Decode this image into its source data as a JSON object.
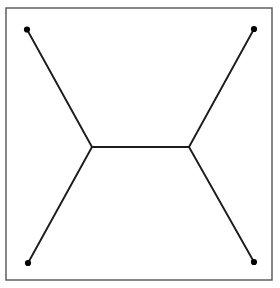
{
  "figure": {
    "background_color": "#ffffff",
    "canvas": {
      "width": 280,
      "height": 288
    },
    "frame": {
      "label": "bounding-box",
      "x": 6,
      "y": 8,
      "width": 266,
      "height": 272,
      "stroke_color": "#555555",
      "stroke_width": 1.4,
      "fill_color": "#ffffff"
    },
    "style": {
      "edge_color": "#1c1c1c",
      "edge_width": 1.9,
      "node_color": "#000000",
      "node_radius": 3.1
    },
    "terminals": [
      {
        "id": "T1",
        "label": "top-left-terminal",
        "x": 27,
        "y": 29.5
      },
      {
        "id": "T2",
        "label": "top-right-terminal",
        "x": 254,
        "y": 29
      },
      {
        "id": "T3",
        "label": "bottom-left-terminal",
        "x": 28,
        "y": 263
      },
      {
        "id": "T4",
        "label": "bottom-right-terminal",
        "x": 254,
        "y": 262
      }
    ],
    "steiner_points": [
      {
        "id": "S1",
        "label": "left-steiner-point",
        "x": 92,
        "y": 147
      },
      {
        "id": "S2",
        "label": "right-steiner-point",
        "x": 189,
        "y": 147
      }
    ],
    "edges": [
      {
        "id": "E1",
        "label": "edge-top-left-to-left-steiner",
        "x1": 27,
        "y1": 29.5,
        "x2": 92,
        "y2": 147
      },
      {
        "id": "E2",
        "label": "edge-bottom-left-to-left-steiner",
        "x1": 28,
        "y1": 263,
        "x2": 92,
        "y2": 147
      },
      {
        "id": "E3",
        "label": "edge-left-steiner-to-right-steiner",
        "x1": 92,
        "y1": 147,
        "x2": 189,
        "y2": 147
      },
      {
        "id": "E4",
        "label": "edge-top-right-to-right-steiner",
        "x1": 254,
        "y1": 29,
        "x2": 189,
        "y2": 147
      },
      {
        "id": "E5",
        "label": "edge-bottom-right-to-right-steiner",
        "x1": 254,
        "y1": 262,
        "x2": 189,
        "y2": 147
      }
    ]
  },
  "chart_data": {
    "type": "scatter",
    "xlabel": "",
    "ylabel": "",
    "xlim": [
      6,
      272
    ],
    "ylim": [
      8,
      280
    ],
    "grid": false,
    "legend": "none",
    "series": [
      {
        "name": "terminals",
        "marker": "filled-circle",
        "x": [
          27,
          254,
          28,
          254
        ],
        "y": [
          29.5,
          29,
          263,
          262
        ],
        "labels": [
          "T1",
          "T2",
          "T3",
          "T4"
        ]
      },
      {
        "name": "steiner-points",
        "marker": "none",
        "x": [
          92,
          189
        ],
        "y": [
          147,
          147
        ],
        "labels": [
          "S1",
          "S2"
        ]
      }
    ],
    "edges": [
      [
        "T1",
        "S1"
      ],
      [
        "T3",
        "S1"
      ],
      [
        "S1",
        "S2"
      ],
      [
        "T2",
        "S2"
      ],
      [
        "T4",
        "S2"
      ]
    ],
    "annotations": []
  }
}
